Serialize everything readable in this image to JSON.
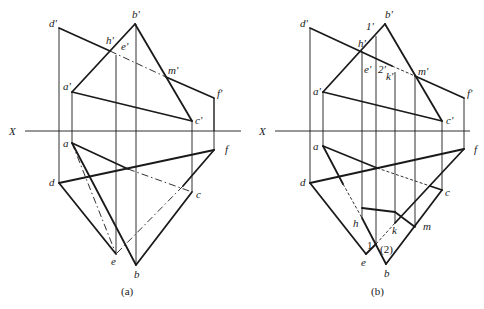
{
  "figure": {
    "axis_label": "X",
    "colors": {
      "line": "#1a1a1a",
      "background": "#ffffff"
    }
  },
  "panels": [
    {
      "id": "a",
      "caption": "(a)",
      "axis_label": "X",
      "front_view_labels": {
        "d_prime": "d'",
        "b_prime": "b'",
        "h_prime": "h'",
        "e_prime": "e'",
        "m_prime": "m'",
        "a_prime": "a'",
        "f_prime": "f'",
        "c_prime": "c'"
      },
      "top_view_labels": {
        "a": "a",
        "d": "d",
        "f": "f",
        "c": "c",
        "e": "e",
        "b": "b"
      }
    },
    {
      "id": "b",
      "caption": "(b)",
      "axis_label": "X",
      "front_view_labels": {
        "d_prime": "d'",
        "one_prime": "1'",
        "b_prime": "b'",
        "h_prime": "h'",
        "e_prime": "e'",
        "two_prime": "2'",
        "k_prime": "k'",
        "m_prime": "m'",
        "a_prime": "a'",
        "f_prime": "f'",
        "c_prime": "c'"
      },
      "top_view_labels": {
        "a": "a",
        "d": "d",
        "f": "f",
        "c": "c",
        "h": "h",
        "k": "k",
        "m": "m",
        "one": "1",
        "two": "(2)",
        "e": "e",
        "b": "b"
      }
    }
  ]
}
